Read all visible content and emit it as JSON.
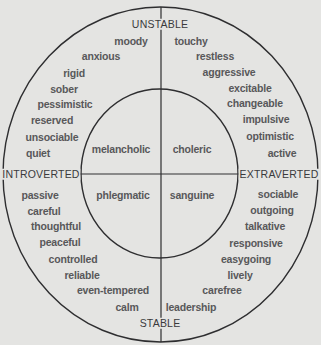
{
  "diagram": {
    "colors": {
      "background": "#e4e4e2",
      "line": "#2e2e30",
      "text": "#58585a",
      "axis_text": "#3a3a3c"
    },
    "axes": {
      "top": "UNSTABLE",
      "bottom": "STABLE",
      "left": "INTROVERTED",
      "right": "EXTRAVERTED"
    },
    "temperaments": {
      "top_left": "melancholic",
      "top_right": "choleric",
      "bottom_left": "phlegmatic",
      "bottom_right": "sanguine"
    },
    "traits": {
      "unstable_introverted": [
        "moody",
        "anxious",
        "rigid",
        "sober",
        "pessimistic",
        "reserved",
        "unsociable",
        "quiet"
      ],
      "unstable_extraverted": [
        "touchy",
        "restless",
        "aggressive",
        "excitable",
        "changeable",
        "impulsive",
        "optimistic",
        "active"
      ],
      "stable_introverted": [
        "passive",
        "careful",
        "thoughtful",
        "peaceful",
        "controlled",
        "reliable",
        "even-tempered",
        "calm"
      ],
      "stable_extraverted": [
        "sociable",
        "outgoing",
        "talkative",
        "responsive",
        "easygoing",
        "lively",
        "carefree",
        "leadership"
      ]
    }
  }
}
